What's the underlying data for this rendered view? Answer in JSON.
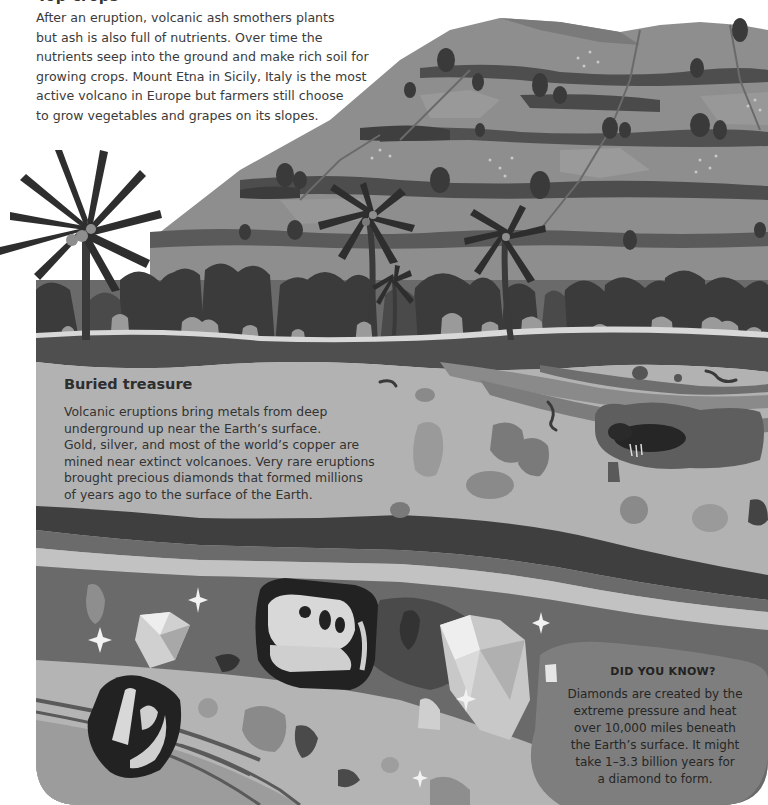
{
  "top_section": {
    "title": "Top crops",
    "lines": [
      "After an eruption, volcanic ash smothers plants",
      "but ash is also full of nutrients. Over time the",
      "nutrients seep into the ground and make rich soil for",
      "growing crops. Mount Etna in Sicily, Italy is the most",
      "active volcano in Europe but farmers still choose",
      "to grow vegetables and grapes on its slopes."
    ]
  },
  "buried_treasure": {
    "title": "Buried treasure",
    "lines": [
      "Volcanic eruptions bring metals from deep",
      "underground up near the Earth’s surface.",
      "Gold, silver, and most of the world’s copper are",
      "mined near extinct volcanoes. Very rare eruptions",
      "brought precious diamonds that formed millions",
      "of years ago to the surface of the Earth."
    ]
  },
  "did_you_know": {
    "title": "DID YOU KNOW?",
    "lines": [
      "Diamonds are created by the",
      "extreme pressure and heat",
      "over 10,000 miles beneath",
      "the Earth’s surface. It might",
      "take 1–3.3 billion years for",
      "a diamond to form."
    ]
  },
  "illustration": {
    "elements": [
      "terraced-hillside",
      "palm-trees",
      "bushes",
      "soil-layers",
      "worms",
      "mole-in-burrow",
      "rocks",
      "diamonds",
      "sparkles",
      "dinosaur-skull-fossil",
      "jaw-bone-fossil"
    ],
    "palette": {
      "hill": "#8c8c8c",
      "hill_band": "#6e6e6e",
      "hedge": "#4a4a4a",
      "bush": "#3d3d3d",
      "palm": "#2e2e2e",
      "topsoil": "#4f4f4f",
      "sand": "#b4b4b4",
      "clay": "#8a8a8a",
      "dark_layer": "#3f3f3f",
      "deep_layer": "#6b6b6b",
      "pale_layer": "#c2c2c2"
    }
  }
}
